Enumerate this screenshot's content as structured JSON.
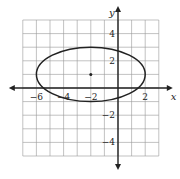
{
  "chart_data": {
    "type": "line",
    "title": "",
    "xlabel": "x",
    "ylabel": "y",
    "xlim": [
      -7,
      3
    ],
    "ylim": [
      -5,
      5
    ],
    "grid": true,
    "x_tick_labels": [
      "-6",
      "-4",
      "-2",
      "2"
    ],
    "y_tick_labels": [
      "4",
      "2",
      "-2",
      "-4"
    ],
    "series": [
      {
        "name": "ellipse",
        "shape": "ellipse",
        "center": [
          -2,
          1
        ],
        "semi_major_x": 4,
        "semi_minor_y": 2
      }
    ],
    "points": [
      {
        "x": -2,
        "y": 1,
        "label": "center"
      }
    ]
  }
}
